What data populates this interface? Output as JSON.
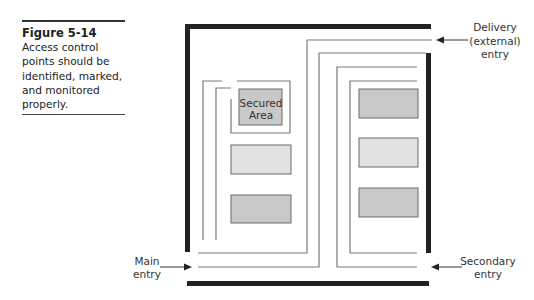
{
  "caption": {
    "figure_label": "Figure 5-14",
    "lines": [
      "Access control",
      "points should be",
      "identified, marked,",
      "and monitored",
      "properly."
    ]
  },
  "diagram": {
    "secured_area": {
      "line1": "Secured",
      "line2": "Area"
    },
    "entries": {
      "delivery": {
        "line1": "Delivery",
        "line2": "(external)",
        "line3": "entry"
      },
      "main": {
        "line1": "Main",
        "line2": "entry"
      },
      "secondary": {
        "line1": "Secondary",
        "line2": "entry"
      }
    },
    "colors": {
      "wall": "#222222",
      "path": "#7a7a7a",
      "box_dark": "#c9c9c9",
      "box_light": "#e2e2e2"
    }
  }
}
